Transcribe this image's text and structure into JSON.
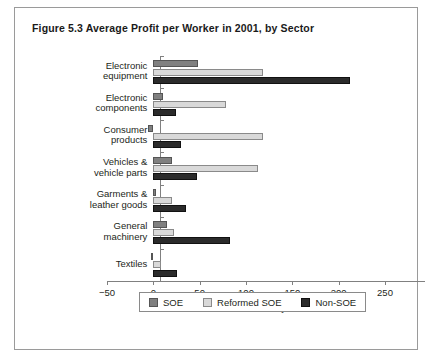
{
  "figure": {
    "title": "Figure 5.3  Average Profit per Worker in 2001, by Sector"
  },
  "chart_data": {
    "type": "bar",
    "orientation": "horizontal",
    "title": "Figure 5.3  Average Profit per Worker in 2001, by Sector",
    "xlabel": "Thousand yuan",
    "ylabel": "",
    "xlim": [
      -50,
      250
    ],
    "xticks": [
      -50,
      0,
      50,
      100,
      150,
      200,
      250
    ],
    "xtick_labels": [
      "−50",
      "0",
      "50",
      "100",
      "150",
      "200",
      "250"
    ],
    "grid": false,
    "legend_position": "bottom",
    "categories": [
      "Electronic equipment",
      "Electronic components",
      "Consumer products",
      "Vehicles & vehicle parts",
      "Garments & leather goods",
      "General machinery",
      "Textiles"
    ],
    "category_lines": [
      [
        "Electronic",
        "equipment"
      ],
      [
        "Electronic",
        "components"
      ],
      [
        "Consumer",
        "products"
      ],
      [
        "Vehicles &",
        "vehicle parts"
      ],
      [
        "Garments &",
        "leather goods"
      ],
      [
        "General",
        "machinery"
      ],
      [
        "Textiles"
      ]
    ],
    "series": [
      {
        "name": "SOE",
        "color": "#808080",
        "values": [
          48,
          10,
          -6,
          20,
          3,
          15,
          -3
        ]
      },
      {
        "name": "Reformed SOE",
        "color": "#d9d9d9",
        "values": [
          118,
          78,
          118,
          113,
          20,
          22,
          8
        ]
      },
      {
        "name": "Non-SOE",
        "color": "#2b2b2b",
        "values": [
          212,
          24,
          30,
          47,
          35,
          83,
          26
        ]
      }
    ]
  },
  "legend": {
    "entries": [
      {
        "label": "SOE",
        "swatch": "soe"
      },
      {
        "label": "Reformed SOE",
        "swatch": "reformed"
      },
      {
        "label": "Non-SOE",
        "swatch": "nonsoe"
      }
    ]
  }
}
